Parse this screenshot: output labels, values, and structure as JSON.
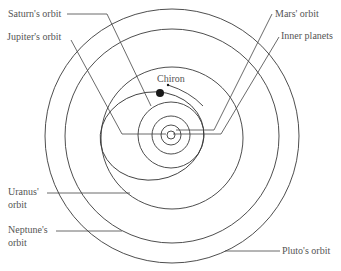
{
  "diagram": {
    "labels": {
      "saturn": "Saturn's orbit",
      "jupiter": "Jupiter's orbit",
      "mars": "Mars' orbit",
      "inner": "Inner planets",
      "chiron": "Chiron",
      "uranus_1": "Uranus'",
      "uranus_2": "orbit",
      "neptune_1": "Neptune's",
      "neptune_2": "orbit",
      "pluto": "Pluto's orbit"
    },
    "colors": {
      "line": "#3a3a3a",
      "text": "#555555",
      "background": "#ffffff"
    }
  }
}
